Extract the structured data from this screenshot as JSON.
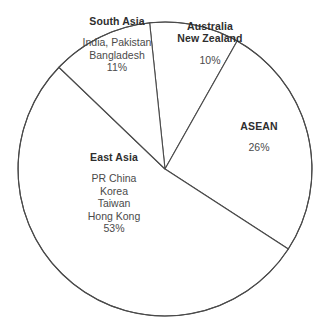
{
  "chart_data": {
    "type": "pie",
    "title": "",
    "subtitle": "",
    "xlabel": "",
    "ylabel": "",
    "legend_position": "inside-slices",
    "grid": false,
    "units": "percent",
    "total": 100,
    "geometry": {
      "center_x": 165,
      "center_y": 169,
      "radius": 147,
      "start_angle_deg_from_north_clockwise": -6
    },
    "style": {
      "slice_fill": "#ffffff",
      "slice_stroke": "#4a4a4a",
      "title_color": "#2e2e2e",
      "text_color": "#4a4a4a",
      "background": "#ffffff"
    },
    "categories": [
      "Australia New Zealand",
      "ASEAN",
      "East Asia",
      "South Asia"
    ],
    "values": [
      10,
      26,
      53,
      11
    ],
    "slices": [
      {
        "name": "australia-new-zealand",
        "title_lines": [
          "Australia",
          "New Zealand"
        ],
        "members": [],
        "value": 10,
        "value_label": "10%",
        "start_angle": -6,
        "end_angle": 29.4,
        "label_x": 210,
        "label_y": 43,
        "value_x": 196,
        "value_y": 76
      },
      {
        "name": "asean",
        "title_lines": [
          "ASEAN"
        ],
        "members": [],
        "value": 26,
        "value_label": "26%",
        "start_angle": 29.4,
        "end_angle": 123.0,
        "label_x": 259,
        "label_y": 137,
        "value_x": 259,
        "value_y": 165
      },
      {
        "name": "east-asia",
        "title_lines": [
          "East Asia"
        ],
        "members": [
          "PR China",
          "Korea",
          "Taiwan",
          "Hong Kong"
        ],
        "value": 53,
        "value_label": "53%",
        "start_angle": 123.0,
        "end_angle": 313.8,
        "label_x": 114,
        "label_y": 193,
        "value_x": 0,
        "value_y": 0
      },
      {
        "name": "south-asia",
        "title_lines": [
          "South Asia"
        ],
        "members": [
          "India, Pakistan",
          "Bangladesh"
        ],
        "value": 11,
        "value_label": "11%",
        "start_angle": 313.8,
        "end_angle": 354.0,
        "label_x": 117,
        "label_y": 44,
        "value_x": 0,
        "value_y": 0
      }
    ]
  }
}
